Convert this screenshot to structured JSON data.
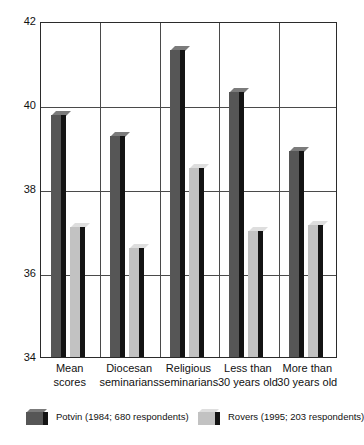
{
  "chart_data": {
    "type": "bar",
    "title": "",
    "subtitle": "",
    "xlabel": "",
    "ylabel": "",
    "ylim": [
      34,
      42
    ],
    "yticks": [
      34,
      36,
      38,
      40,
      42
    ],
    "ytick_labels": [
      "34",
      "36",
      "38",
      "40",
      "42"
    ],
    "grid": "horizontal and vertical category separators",
    "legend_position": "bottom",
    "categories": [
      "Mean scores",
      "Diocesan seminarians",
      "Religious seminarians",
      "Less than 30 years old",
      "More than 30 years old"
    ],
    "category_lines": [
      [
        "Mean",
        "scores"
      ],
      [
        "Diocesan",
        "seminarians"
      ],
      [
        "Religious",
        "seminarians"
      ],
      [
        "Less than",
        "30 years old"
      ],
      [
        "More than",
        "30 years old"
      ]
    ],
    "series": [
      {
        "name": "Potvin (1984; 680 respondents)",
        "color": "#565656",
        "values": [
          39.85,
          39.35,
          41.4,
          40.4,
          39.0
        ]
      },
      {
        "name": "Rovers (1995; 203 respondents)",
        "color": "#c2c2c2",
        "values": [
          37.2,
          36.7,
          38.6,
          37.1,
          37.25
        ]
      }
    ]
  },
  "legend": {
    "entries": [
      {
        "label": "Potvin (1984; 680 respondents)",
        "series_key": "series-potvin"
      },
      {
        "label": "Rovers (1995; 203 respondents)",
        "series_key": "series-rovers"
      }
    ]
  },
  "colors": {
    "potvin": "#565656",
    "rovers": "#c2c2c2",
    "bar_side": "#141414",
    "axis": "#2b2b2b",
    "grid": "#4a4a4a",
    "background": "#ffffff"
  }
}
